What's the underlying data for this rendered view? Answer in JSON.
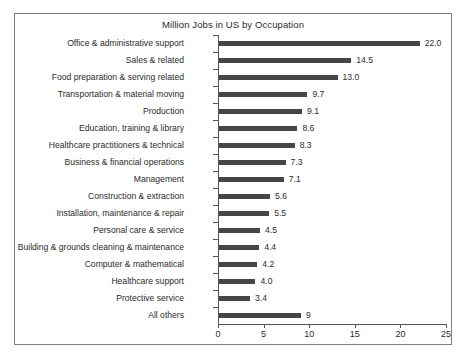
{
  "chart_data": {
    "type": "bar",
    "orientation": "horizontal",
    "title": "Million Jobs in US by Occupation",
    "xlabel": "",
    "ylabel": "",
    "xlim": [
      0,
      25
    ],
    "xticks": [
      0,
      5,
      10,
      15,
      20,
      25
    ],
    "grid": false,
    "legend": null,
    "bar_color": "#464646",
    "categories": [
      "Office & administrative support",
      "Sales & related",
      "Food preparation & serving related",
      "Transportation & material moving",
      "Production",
      "Education, training & library",
      "Healthcare practitioners & technical",
      "Business & financial operations",
      "Management",
      "Construction & extraction",
      "Installation, maintenance & repair",
      "Personal care & service",
      "Building & grounds cleaning & maintenance",
      "Computer & mathematical",
      "Healthcare support",
      "Protective service",
      "All others"
    ],
    "values": [
      22.0,
      14.5,
      13.0,
      9.7,
      9.1,
      8.6,
      8.3,
      7.3,
      7.1,
      5.6,
      5.5,
      4.5,
      4.4,
      4.2,
      4.0,
      3.4,
      9
    ],
    "value_labels": [
      "22.0",
      "14.5",
      "13.0",
      "9.7",
      "9.1",
      "8.6",
      "8.3",
      "7.3",
      "7.1",
      "5.6",
      "5.5",
      "4.5",
      "4.4",
      "4.2",
      "4.0",
      "3.4",
      "9"
    ],
    "xtick_labels": [
      "0",
      "5",
      "10",
      "15",
      "20",
      "25"
    ]
  }
}
